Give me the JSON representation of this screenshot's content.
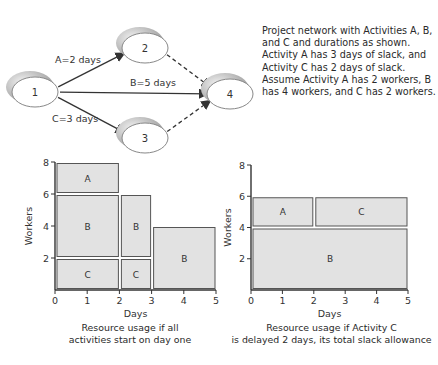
{
  "network": {
    "nodes": [
      {
        "id": "1",
        "label": "1"
      },
      {
        "id": "2",
        "label": "2"
      },
      {
        "id": "3",
        "label": "3"
      },
      {
        "id": "4",
        "label": "4"
      }
    ],
    "edges": [
      {
        "from": "1",
        "to": "2",
        "label": "A=2 days",
        "style": "solid"
      },
      {
        "from": "1",
        "to": "4",
        "label": "B=5 days",
        "style": "solid"
      },
      {
        "from": "1",
        "to": "3",
        "label": "C=3 days",
        "style": "solid"
      },
      {
        "from": "2",
        "to": "4",
        "label": "",
        "style": "dashed"
      },
      {
        "from": "3",
        "to": "4",
        "label": "",
        "style": "dashed"
      }
    ]
  },
  "description": "Project network with Activities A, B, and C and durations as shown. Activity A has 3 days of slack, and Activity C has 2 days of slack. Assume Activity A has 2 workers, B has 4 workers, and C has 2 workers.",
  "chart_data": [
    {
      "type": "bar",
      "title": "Resource usage if all activities start on day one",
      "xlabel": "Days",
      "ylabel": "Workers",
      "xlim": [
        0,
        5
      ],
      "ylim": [
        0,
        8
      ],
      "xticks": [
        "0",
        "1",
        "2",
        "3",
        "4",
        "5"
      ],
      "yticks": [
        "2",
        "4",
        "6",
        "8"
      ],
      "blocks": [
        {
          "label": "C",
          "x0": 0,
          "x1": 2,
          "y0": 0,
          "y1": 2
        },
        {
          "label": "B",
          "x0": 0,
          "x1": 2,
          "y0": 2,
          "y1": 6
        },
        {
          "label": "A",
          "x0": 0,
          "x1": 2,
          "y0": 6,
          "y1": 8
        },
        {
          "label": "C",
          "x0": 2,
          "x1": 3,
          "y0": 0,
          "y1": 2
        },
        {
          "label": "B",
          "x0": 2,
          "x1": 3,
          "y0": 2,
          "y1": 6
        },
        {
          "label": "B",
          "x0": 3,
          "x1": 5,
          "y0": 0,
          "y1": 4
        }
      ]
    },
    {
      "type": "bar",
      "title": "Resource usage if Activity C is delayed 2 days, its total slack allowance",
      "xlabel": "Days",
      "ylabel": "Workers",
      "xlim": [
        0,
        5
      ],
      "ylim": [
        0,
        8
      ],
      "xticks": [
        "0",
        "1",
        "2",
        "3",
        "4",
        "5"
      ],
      "yticks": [
        "2",
        "4",
        "6",
        "8"
      ],
      "blocks": [
        {
          "label": "B",
          "x0": 0,
          "x1": 5,
          "y0": 0,
          "y1": 4
        },
        {
          "label": "A",
          "x0": 0,
          "x1": 2,
          "y0": 4,
          "y1": 6
        },
        {
          "label": "C",
          "x0": 2,
          "x1": 5,
          "y0": 4,
          "y1": 6
        }
      ]
    }
  ],
  "captions": {
    "left": [
      "Resource usage if all",
      "activities start on day one"
    ],
    "right": [
      "Resource usage if Activity C",
      "is delayed 2 days, its total slack allowance"
    ]
  },
  "colors": {
    "block_fill": "#e2e2e2",
    "block_stroke": "#555555",
    "axis": "#333333"
  }
}
